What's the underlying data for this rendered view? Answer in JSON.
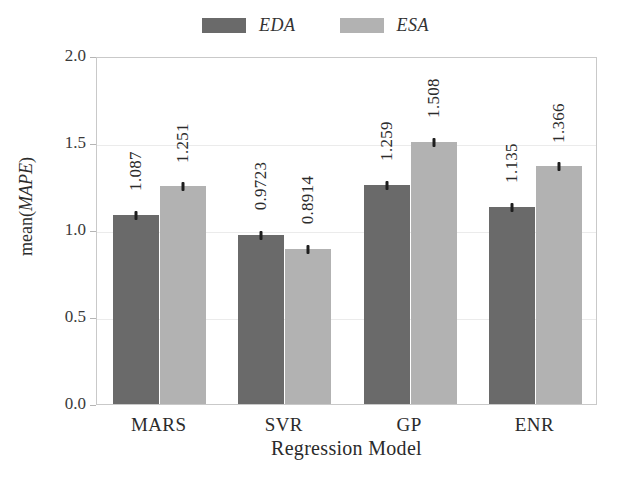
{
  "chart_data": {
    "type": "bar",
    "title": "",
    "xlabel": "Regression Model",
    "ylabel_prefix": "mean(",
    "ylabel_italic": "MAPE",
    "ylabel_suffix": ")",
    "ylabel_full": "mean(MAPE)",
    "categories": [
      "MARS",
      "SVR",
      "GP",
      "ENR"
    ],
    "ylim": [
      0.0,
      2.0
    ],
    "yticks": [
      "0.0",
      "0.5",
      "1.0",
      "1.5",
      "2.0"
    ],
    "ytick_values": [
      0.0,
      0.5,
      1.0,
      1.5,
      2.0
    ],
    "grid": true,
    "grid_axis": "y",
    "legend_position": "top-center",
    "series": [
      {
        "name": "EDA",
        "color": "#6a6a6a",
        "values": [
          1.087,
          0.9723,
          1.259,
          1.135
        ],
        "labels": [
          "1.087",
          "0.9723",
          "1.259",
          "1.135"
        ]
      },
      {
        "name": "ESA",
        "color": "#b2b2b2",
        "values": [
          1.251,
          0.8914,
          1.508,
          1.366
        ],
        "labels": [
          "1.251",
          "0.8914",
          "1.508",
          "1.366"
        ]
      }
    ],
    "error_bars": true,
    "value_labels_rotated": true
  },
  "legend": {
    "entries": [
      {
        "label": "EDA",
        "swatch_name": "legend-swatch-eda"
      },
      {
        "label": "ESA",
        "swatch_name": "legend-swatch-esa"
      }
    ]
  },
  "colors": {
    "eda": "#6a6a6a",
    "esa": "#b2b2b2",
    "grid": "#ebebeb",
    "frame": "#c9c9c9",
    "background": "#ffffff",
    "text": "#2b2b2b"
  }
}
